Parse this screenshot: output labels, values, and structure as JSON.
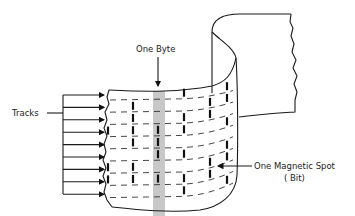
{
  "labels": {
    "byte": "One Byte",
    "tracks": "Tracks",
    "bit_line1": "One Magnetic Spot",
    "bit_line2": "( Bit)"
  },
  "track_count": 9,
  "colors": {
    "byte_band": "#c8c8c8",
    "ink": "#1a1a1a"
  }
}
